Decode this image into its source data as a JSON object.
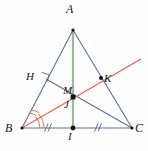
{
  "figure": {
    "type": "geometry-diagram",
    "width": 148,
    "height": 151,
    "background": "#fefefe"
  },
  "colors": {
    "triangle_stroke": "#5b6f9c",
    "median_stroke": "#9fb89a",
    "bisector_stroke": "#e0614a",
    "angle_arc": "#e0614a",
    "tick_mark": "#5b6f9c",
    "right_angle": "#5b6f9c",
    "point_fill": "#111111",
    "label_color": "#1a1a1a"
  },
  "points": {
    "A": {
      "label": "A",
      "x": 73,
      "y": 30
    },
    "B": {
      "label": "B",
      "x": 22,
      "y": 128
    },
    "C": {
      "label": "C",
      "x": 132,
      "y": 128
    },
    "H": {
      "label": "H",
      "x": 47,
      "y": 80
    },
    "I": {
      "label": "I",
      "x": 73,
      "y": 128
    },
    "J": {
      "label": "J",
      "x": 73,
      "y": 97
    },
    "K": {
      "label": "K",
      "x": 101,
      "y": 78
    },
    "M": {
      "label": "M",
      "x": 73,
      "y": 97
    }
  },
  "segments": {
    "AB": {
      "name": "side-AB",
      "from": "A",
      "to": "B"
    },
    "AC": {
      "name": "side-AC",
      "from": "A",
      "to": "C"
    },
    "BC": {
      "name": "side-BC",
      "from": "B",
      "to": "C"
    },
    "AI": {
      "name": "median-AI",
      "from": "A",
      "to": "I"
    },
    "HC": {
      "name": "altitude-HC",
      "from": "H",
      "to": "C"
    },
    "bisector": {
      "name": "angle-bisector-from-B",
      "from": "B",
      "to": "K"
    }
  },
  "marks": {
    "right_angle_at_H": "right-angle",
    "congruent_ticks": "//",
    "angle_arcs_at_B": 2
  }
}
